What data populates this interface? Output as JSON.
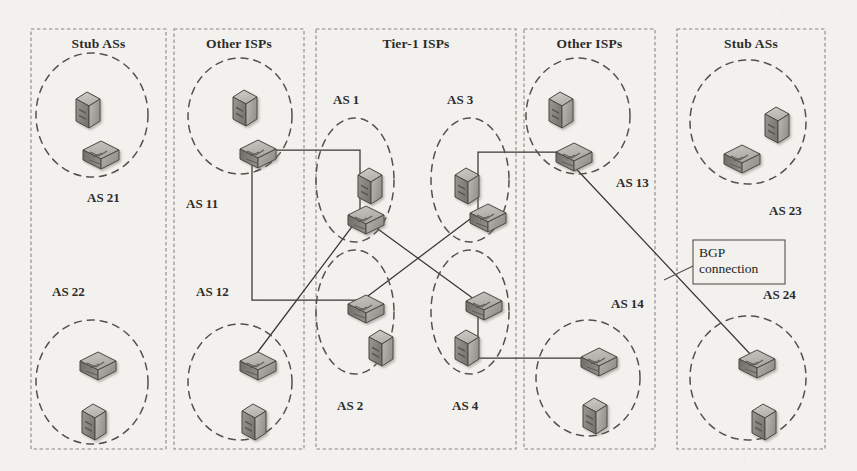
{
  "figure": {
    "kind": "network-topology-diagram",
    "caption_visible": false,
    "background_color": "#f2f1ee",
    "ink_color": "#3a3734"
  },
  "panels": [
    {
      "id": "stub-left",
      "title": "Stub ASs",
      "x": 31,
      "y": 29,
      "w": 135,
      "h": 420
    },
    {
      "id": "isp-left",
      "title": "Other ISPs",
      "x": 174,
      "y": 29,
      "w": 130,
      "h": 420
    },
    {
      "id": "tier1",
      "title": "Tier-1 ISPs",
      "x": 316,
      "y": 29,
      "w": 200,
      "h": 420
    },
    {
      "id": "isp-right",
      "title": "Other ISPs",
      "x": 524,
      "y": 29,
      "w": 131,
      "h": 420
    },
    {
      "id": "stub-right",
      "title": "Stub ASs",
      "x": 677,
      "y": 29,
      "w": 148,
      "h": 420
    }
  ],
  "autonomous_systems": [
    {
      "id": "as21",
      "label": "AS 21",
      "label_x": 87,
      "label_y": 190,
      "cx": 92,
      "cy": 115,
      "rx": 56,
      "ry": 62
    },
    {
      "id": "as22",
      "label": "AS 22",
      "label_x": 52,
      "label_y": 284,
      "cx": 92,
      "cy": 382,
      "rx": 56,
      "ry": 62
    },
    {
      "id": "as11",
      "label": "AS 11",
      "label_x": 186,
      "label_y": 196,
      "cx": 240,
      "cy": 116,
      "rx": 52,
      "ry": 58
    },
    {
      "id": "as12",
      "label": "AS 12",
      "label_x": 196,
      "label_y": 284,
      "cx": 240,
      "cy": 382,
      "rx": 52,
      "ry": 58
    },
    {
      "id": "as1",
      "label": "AS 1",
      "label_x": 333,
      "label_y": 92,
      "cx": 355,
      "cy": 180,
      "rx": 39,
      "ry": 62
    },
    {
      "id": "as3",
      "label": "AS 3",
      "label_x": 447,
      "label_y": 92,
      "cx": 470,
      "cy": 180,
      "rx": 39,
      "ry": 62
    },
    {
      "id": "as2",
      "label": "AS 2",
      "label_x": 337,
      "label_y": 398,
      "cx": 355,
      "cy": 312,
      "rx": 39,
      "ry": 62
    },
    {
      "id": "as4",
      "label": "AS 4",
      "label_x": 452,
      "label_y": 398,
      "cx": 470,
      "cy": 312,
      "rx": 39,
      "ry": 62
    },
    {
      "id": "as13",
      "label": "AS 13",
      "label_x": 616,
      "label_y": 175,
      "cx": 578,
      "cy": 116,
      "rx": 52,
      "ry": 58
    },
    {
      "id": "as14",
      "label": "AS 14",
      "label_x": 611,
      "label_y": 296,
      "cx": 588,
      "cy": 378,
      "rx": 52,
      "ry": 58
    },
    {
      "id": "as23",
      "label": "AS 23",
      "label_x": 769,
      "label_y": 203,
      "cx": 748,
      "cy": 122,
      "rx": 58,
      "ry": 62
    },
    {
      "id": "as24",
      "label": "AS 24",
      "label_x": 763,
      "label_y": 287,
      "cx": 748,
      "cy": 378,
      "rx": 58,
      "ry": 62
    }
  ],
  "nodes": [
    {
      "id": "h21",
      "type": "host",
      "as": "as21",
      "x": 76,
      "y": 92
    },
    {
      "id": "r21",
      "type": "router",
      "as": "as21",
      "x": 83,
      "y": 141
    },
    {
      "id": "r22",
      "type": "router",
      "as": "as22",
      "x": 80,
      "y": 352
    },
    {
      "id": "h22",
      "type": "host",
      "as": "as22",
      "x": 82,
      "y": 404
    },
    {
      "id": "h11",
      "type": "host",
      "as": "as11",
      "x": 233,
      "y": 90
    },
    {
      "id": "r11",
      "type": "router",
      "as": "as11",
      "x": 240,
      "y": 140
    },
    {
      "id": "r12",
      "type": "router",
      "as": "as12",
      "x": 240,
      "y": 352
    },
    {
      "id": "h12",
      "type": "host",
      "as": "as12",
      "x": 242,
      "y": 404
    },
    {
      "id": "h1",
      "type": "host",
      "as": "as1",
      "x": 358,
      "y": 168
    },
    {
      "id": "r1",
      "type": "router",
      "as": "as1",
      "x": 348,
      "y": 206
    },
    {
      "id": "h3",
      "type": "host",
      "as": "as3",
      "x": 455,
      "y": 168
    },
    {
      "id": "r3",
      "type": "router",
      "as": "as3",
      "x": 470,
      "y": 204
    },
    {
      "id": "r2",
      "type": "router",
      "as": "as2",
      "x": 348,
      "y": 295
    },
    {
      "id": "h2",
      "type": "host",
      "as": "as2",
      "x": 369,
      "y": 330
    },
    {
      "id": "r4",
      "type": "router",
      "as": "as4",
      "x": 466,
      "y": 292
    },
    {
      "id": "h4",
      "type": "host",
      "as": "as4",
      "x": 455,
      "y": 330
    },
    {
      "id": "h13",
      "type": "host",
      "as": "as13",
      "x": 549,
      "y": 92
    },
    {
      "id": "r13",
      "type": "router",
      "as": "as13",
      "x": 556,
      "y": 143
    },
    {
      "id": "r14",
      "type": "router",
      "as": "as14",
      "x": 581,
      "y": 348
    },
    {
      "id": "h14",
      "type": "host",
      "as": "as14",
      "x": 583,
      "y": 398
    },
    {
      "id": "h23",
      "type": "host",
      "as": "as23",
      "x": 765,
      "y": 107
    },
    {
      "id": "r23",
      "type": "router",
      "as": "as23",
      "x": 724,
      "y": 145
    },
    {
      "id": "r24",
      "type": "router",
      "as": "as24",
      "x": 739,
      "y": 350
    },
    {
      "id": "h24",
      "type": "host",
      "as": "as24",
      "x": 752,
      "y": 404
    }
  ],
  "links": [
    {
      "id": "l-r21-r11",
      "kind": "bgp",
      "points": "97,150 252,150"
    },
    {
      "id": "l-r11-down",
      "kind": "bgp",
      "points": "252,150 252,300 372,300"
    },
    {
      "id": "l-r11-r1",
      "kind": "bgp",
      "points": "252,150 360,150 360,216"
    },
    {
      "id": "l-r22-r12",
      "kind": "bgp",
      "points": "95,361 252,361"
    },
    {
      "id": "l-r12-r2",
      "kind": "bgp",
      "points": "252,361 372,361"
    },
    {
      "id": "l-r12-r1",
      "kind": "bgp",
      "points": "254,357 360,216"
    },
    {
      "id": "l-r1-r3",
      "kind": "bgp",
      "points": "372,213 478,213"
    },
    {
      "id": "l-r2-r4",
      "kind": "bgp",
      "points": "372,302 478,302"
    },
    {
      "id": "l-r1-r4",
      "kind": "bgp",
      "points": "360,216 478,302"
    },
    {
      "id": "l-r3-r2",
      "kind": "bgp",
      "points": "478,213 360,302"
    },
    {
      "id": "l-r3-r13",
      "kind": "bgp",
      "points": "478,213 478,152 568,152"
    },
    {
      "id": "l-r13-r23",
      "kind": "bgp",
      "points": "568,152 736,152"
    },
    {
      "id": "l-r4-r14",
      "kind": "bgp",
      "points": "478,302 478,358 594,358"
    },
    {
      "id": "l-r14-r24",
      "kind": "bgp",
      "points": "594,358 752,358"
    },
    {
      "id": "l-r13-r24",
      "kind": "bgp",
      "points": "566,158 752,356"
    }
  ],
  "callout": {
    "line1": "BGP",
    "line2": "connection",
    "box": {
      "x": 693,
      "y": 240,
      "w": 92,
      "h": 44
    },
    "leader": "693,266 664,280"
  }
}
